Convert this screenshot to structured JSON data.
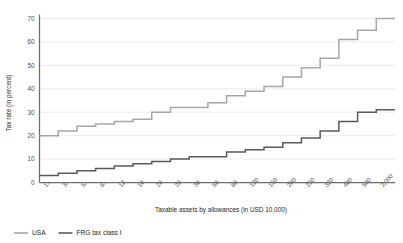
{
  "chart_data": {
    "type": "line",
    "subtype": "step",
    "title": "",
    "xlabel": "Taxable assets by allowances (in USD 10,000)",
    "ylabel": "Tax rate (in percent)",
    "ylim": [
      0,
      70
    ],
    "yticks": [
      0,
      10,
      20,
      30,
      40,
      50,
      60,
      70
    ],
    "grid": true,
    "legend_position": "bottom-left",
    "categories": [
      "1",
      "3",
      "5",
      "8",
      "12",
      "16",
      "24",
      "28",
      "36",
      "50",
      "80",
      "120",
      "150",
      "200",
      "250",
      "320",
      "400",
      "500",
      "2,000"
    ],
    "series": [
      {
        "name": "USA",
        "color": "#a6a6a6",
        "values": [
          20,
          22,
          24,
          25,
          26,
          27,
          30,
          32,
          32,
          34,
          37,
          39,
          41,
          45,
          49,
          53,
          61,
          65,
          70
        ]
      },
      {
        "name": "FRG tax class I",
        "color": "#595959",
        "values": [
          3,
          4,
          5,
          6,
          7,
          8,
          9,
          10,
          11,
          11,
          13,
          14,
          15,
          17,
          19,
          22,
          26,
          30,
          31
        ]
      }
    ]
  },
  "axes": {
    "y_title": "Tax rate (in percent)",
    "x_title": "Taxable assets by allowances (in USD 10,000)",
    "y_tick_labels": [
      "70",
      "60",
      "50",
      "40",
      "30",
      "20",
      "10",
      "0"
    ],
    "x_tick_labels": [
      "1",
      "3",
      "5",
      "8",
      "12",
      "16",
      "24",
      "28",
      "36",
      "50",
      "80",
      "120",
      "150",
      "200",
      "250",
      "320",
      "400",
      "500",
      "2,000"
    ]
  },
  "legend": {
    "items": [
      {
        "label": "USA",
        "color": "#a6a6a6"
      },
      {
        "label": "FRG tax class I",
        "color": "#595959"
      }
    ]
  },
  "colors": {
    "usa": "#a6a6a6",
    "frg": "#595959",
    "grid": "#e3e3e3",
    "axis": "#6d6d6d",
    "text": "#231f20"
  }
}
